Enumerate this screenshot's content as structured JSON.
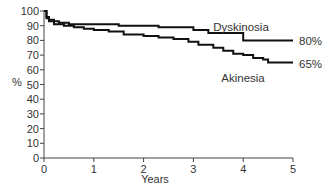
{
  "chart_data": {
    "type": "line",
    "title": "",
    "xlabel": "Years",
    "ylabel": "%",
    "xlim": [
      0,
      5
    ],
    "ylim": [
      0,
      100
    ],
    "x_ticks": [
      "0",
      "1",
      "2",
      "3",
      "4",
      "5"
    ],
    "y_ticks": [
      "0",
      "10",
      "20",
      "30",
      "40",
      "50",
      "60",
      "70",
      "80",
      "90",
      "100"
    ],
    "grid": false,
    "legend": "inline labels at line ends",
    "series": [
      {
        "name": "Dyskinosia",
        "end_label": "80%",
        "step": true,
        "x": [
          0,
          0.05,
          0.1,
          0.2,
          0.3,
          0.5,
          1.0,
          1.5,
          2.0,
          2.3,
          2.8,
          3.0,
          3.3,
          3.5,
          3.8,
          4.0,
          4.5,
          5.0
        ],
        "y": [
          100,
          96,
          94,
          93,
          92,
          91,
          91,
          90,
          90,
          89,
          89,
          87,
          85,
          85,
          85,
          80,
          80,
          80
        ]
      },
      {
        "name": "Akinesia",
        "end_label": "65%",
        "step": true,
        "x": [
          0,
          0.05,
          0.1,
          0.2,
          0.4,
          0.6,
          0.8,
          1.0,
          1.3,
          1.6,
          2.0,
          2.3,
          2.6,
          2.9,
          3.1,
          3.4,
          3.6,
          3.8,
          4.0,
          4.2,
          4.4,
          4.5,
          4.7,
          5.0
        ],
        "y": [
          100,
          95,
          93,
          91,
          90,
          89,
          88,
          87,
          86,
          84,
          83,
          82,
          81,
          79,
          77,
          75,
          73,
          71,
          70,
          68,
          67,
          65,
          65,
          65
        ]
      }
    ]
  },
  "labels": {
    "y_axis_title": "%",
    "x_axis_title": "Years",
    "dyskinosia": "Dyskinosia",
    "dyskinosia_pct": "80%",
    "akinesia": "Akinesia",
    "akinesia_pct": "65%"
  }
}
